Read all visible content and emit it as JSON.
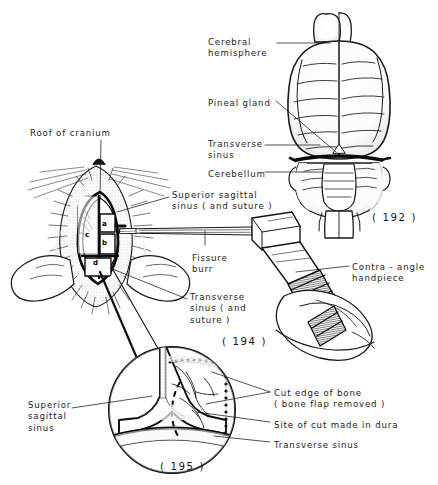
{
  "plate": {
    "title": "Craniotomy and dorsal brain anatomy plate",
    "background_color": "#ffffff",
    "ink_color": "#1a1a1a"
  },
  "figures": [
    {
      "number": "( 192 )",
      "caption_x": 372,
      "caption_y": 212,
      "subject": "Dorsal view of brain"
    },
    {
      "number": "( 194 )",
      "caption_x": 222,
      "caption_y": 336,
      "subject": "Craniotomy with contra-angle handpiece"
    },
    {
      "number": "( 195 )",
      "caption_x": 160,
      "caption_y": 461,
      "subject": "Magnified view of exposed sinuses"
    }
  ],
  "labels": [
    {
      "id": "cerebral-hemisphere",
      "text": "Cerebral\nhemisphere",
      "x": 208,
      "y": 37,
      "align": "left"
    },
    {
      "id": "pineal-gland",
      "text": "Pineal gland",
      "x": 208,
      "y": 98,
      "align": "left"
    },
    {
      "id": "transverse-sinus-top",
      "text": "Transverse\nsinus",
      "x": 208,
      "y": 139,
      "align": "left"
    },
    {
      "id": "cerebellum",
      "text": "Cerebellum",
      "x": 208,
      "y": 169,
      "align": "left"
    },
    {
      "id": "roof-of-cranium",
      "text": "Roof of cranium",
      "x": 30,
      "y": 128,
      "align": "left"
    },
    {
      "id": "superior-sagittal-suture",
      "text": "Superior sagittal\nsinus ( and suture )",
      "x": 172,
      "y": 190,
      "align": "left"
    },
    {
      "id": "fissure-burr",
      "text": "Fissure\nburr",
      "x": 192,
      "y": 253,
      "align": "left"
    },
    {
      "id": "transverse-sinus-suture",
      "text": "Transverse\nsinus ( and\nsuture )",
      "x": 190,
      "y": 292,
      "align": "left"
    },
    {
      "id": "contra-angle-handpiece",
      "text": "Contra - angle\nhandpiece",
      "x": 352,
      "y": 262,
      "align": "left"
    },
    {
      "id": "superior-sagittal-sinus-inset",
      "text": "Superior\nsagittal\nsinus",
      "x": 28,
      "y": 400,
      "align": "left"
    },
    {
      "id": "cut-edge-of-bone",
      "text": "Cut edge of bone\n( bone flap removed )",
      "x": 274,
      "y": 388,
      "align": "left"
    },
    {
      "id": "site-of-cut-in-dura",
      "text": "Site of cut made in dura",
      "x": 274,
      "y": 420,
      "align": "left"
    },
    {
      "id": "transverse-sinus-inset",
      "text": "Transverse sinus",
      "x": 274,
      "y": 440,
      "align": "left"
    }
  ],
  "point_markers": [
    {
      "id": "marker-a",
      "text": "a",
      "x": 100,
      "y": 224
    },
    {
      "id": "marker-b",
      "text": "b",
      "x": 100,
      "y": 243
    },
    {
      "id": "marker-c",
      "text": "c",
      "x": 83,
      "y": 235
    },
    {
      "id": "marker-d",
      "text": "d",
      "x": 90,
      "y": 262
    }
  ]
}
